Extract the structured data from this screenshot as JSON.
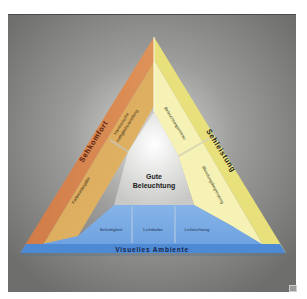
{
  "diagram": {
    "center_label": [
      "Gute",
      "Beleuchtung"
    ],
    "sides": {
      "left": {
        "title": "Sehkomfort",
        "items": [
          "Harmonische Helligkeitsverteilung",
          "Farbwiedergabe"
        ]
      },
      "right": {
        "title": "Sehleistung",
        "items": [
          "Beleuchtungsniveau",
          "Blendungsbegrenzung"
        ]
      },
      "bottom": {
        "title": "Visuelles Ambiente",
        "items": [
          "Schattigkeit",
          "Lichtfarbe",
          "Lichtrichtung"
        ]
      }
    },
    "colors": {
      "background_panel": "#7a7a78",
      "left_outer": "#d98a52",
      "left_inner": "#ddb062",
      "right_outer": "#e8e27a",
      "right_inner": "#f6f2b4",
      "bottom_outer": "#4f8fd8",
      "bottom_inner": "#7fb0e6",
      "center": "#e4e4e2",
      "text_dark": "#222222",
      "text_title": "#1a2a55"
    }
  }
}
